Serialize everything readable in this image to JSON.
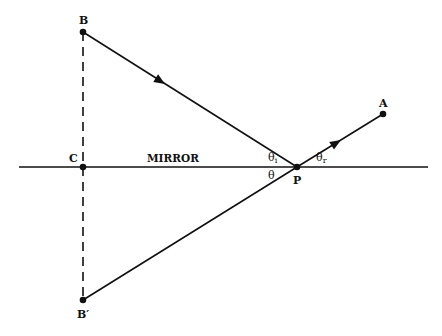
{
  "diagram": {
    "colors": {
      "line": "#111111",
      "background": "#ffffff"
    },
    "points": {
      "B": {
        "label": "B",
        "x": 83,
        "y": 32
      },
      "C": {
        "label": "C",
        "x": 83,
        "y": 167
      },
      "P": {
        "label": "P",
        "x": 297,
        "y": 167
      },
      "A": {
        "label": "A",
        "x": 383,
        "y": 114
      },
      "Bprime": {
        "label": "B′",
        "x": 83,
        "y": 300
      }
    },
    "mirror": {
      "label": "MIRROR",
      "x1": 19,
      "x2": 428,
      "y": 167
    },
    "angles": {
      "incidence": {
        "symbol": "θ",
        "sub": "i"
      },
      "reflection": {
        "symbol": "θ",
        "sub": "r"
      },
      "image": {
        "symbol": "θ"
      }
    },
    "rays": [
      {
        "from": "B",
        "to": "P",
        "style": "solid",
        "arrow": true
      },
      {
        "from": "P",
        "to": "A",
        "style": "solid",
        "arrow": true
      },
      {
        "from": "Bprime",
        "to": "P",
        "style": "solid",
        "arrow": false
      },
      {
        "from": "B",
        "to": "Bprime",
        "style": "dashed",
        "arrow": false
      }
    ]
  }
}
